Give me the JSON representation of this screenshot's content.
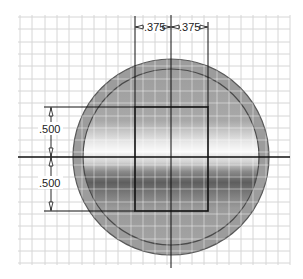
{
  "drawing": {
    "type": "sketch-dimensioned-rectangle-in-circle",
    "grid": {
      "x0": 20,
      "y0": 15,
      "x1": 290,
      "y1": 265,
      "spacing": 12.3,
      "color": "#d4d4d4"
    },
    "circle": {
      "cx": 171,
      "cy": 157,
      "outer_r": 98,
      "inner_r": 88,
      "ring_color": "#9a9a9a",
      "edge_color": "#555555"
    },
    "centerlines": {
      "h_y": 157,
      "v_x": 171
    },
    "rectangle": {
      "x": 135,
      "y": 107,
      "w": 73,
      "h": 104
    },
    "dimensions": {
      "top_left": ".375",
      "top_right": ".375",
      "left_upper": ".500",
      "left_lower": ".500"
    }
  }
}
